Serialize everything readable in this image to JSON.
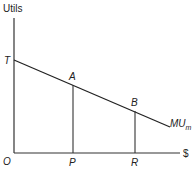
{
  "diagram": {
    "y_axis_label": "Utils",
    "x_axis_label": "$",
    "origin_label": "O",
    "intercept_label": "T",
    "point_a_label": "A",
    "point_b_label": "B",
    "point_p_label": "P",
    "point_r_label": "R",
    "curve_label_main": "MU",
    "curve_label_sub": "m",
    "line_color": "#222222"
  }
}
